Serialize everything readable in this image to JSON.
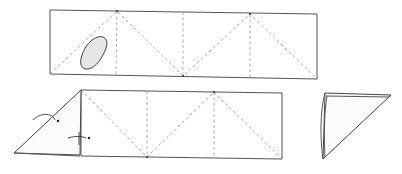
{
  "diagram": {
    "type": "folding-instructions",
    "steps": [
      {
        "id": "step-1",
        "description": "Flat paper strip divided into four squares with vertical crease lines and zigzag diagonal creases; stain/blob in first square",
        "outline": [
          [
            50,
            10
          ],
          [
            317,
            14
          ],
          [
            317,
            79
          ],
          [
            50,
            74
          ]
        ],
        "vertical_creases_x": [
          117,
          183,
          250
        ],
        "zigzag": [
          [
            50,
            74
          ],
          [
            117,
            11
          ],
          [
            183,
            76
          ],
          [
            250,
            14
          ],
          [
            317,
            79
          ]
        ],
        "blob_center": [
          97,
          55
        ]
      },
      {
        "id": "step-2",
        "description": "First segment folded over along diagonal; curved arrows indicate continued rolling fold",
        "outline": [
          [
            81,
            90
          ],
          [
            282,
            93
          ],
          [
            282,
            159
          ],
          [
            81,
            156
          ]
        ],
        "vertical_creases_x": [
          147,
          214
        ],
        "zigzag": [
          [
            81,
            90
          ],
          [
            147,
            157
          ],
          [
            214,
            92
          ],
          [
            282,
            159
          ]
        ],
        "flap": [
          [
            14,
            153
          ],
          [
            81,
            90
          ],
          [
            80,
            155
          ]
        ],
        "arrows": 2
      },
      {
        "id": "step-3",
        "description": "Resulting folded triangle",
        "outline": [
          [
            325,
            93
          ],
          [
            391,
            95
          ],
          [
            323,
            159
          ]
        ]
      }
    ],
    "colors": {
      "line": "#555555",
      "crease": "#999999",
      "background": "#ffffff"
    }
  }
}
